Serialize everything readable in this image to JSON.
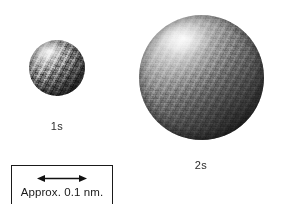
{
  "figure": {
    "background_color": "#ffffff",
    "width": 281,
    "height": 204
  },
  "orbitals": [
    {
      "id": "1s",
      "label": "1s",
      "shape": "sphere",
      "center_x": 57,
      "center_y": 68,
      "diameter": 56,
      "label_x": 57,
      "label_y": 120,
      "highlight_color": "#ffffff",
      "shadow_color": "#0a0a0a",
      "surface_style": "mottled-dithered-grayscale",
      "light_direction": "upper-left"
    },
    {
      "id": "2s",
      "label": "2s",
      "shape": "sphere",
      "center_x": 201,
      "center_y": 77,
      "diameter": 125,
      "label_x": 201,
      "label_y": 159,
      "highlight_color": "#ffffff",
      "shadow_color": "#0a0a0a",
      "surface_style": "smooth-dithered-grayscale",
      "light_direction": "upper-left"
    }
  ],
  "scale_bar": {
    "caption": "Approx. 0.1 nm.",
    "arrow_type": "double-headed-horizontal",
    "border_color": "#1a1a1a",
    "box_x": 11,
    "box_y": 165,
    "box_width": 102,
    "box_height": 44
  }
}
